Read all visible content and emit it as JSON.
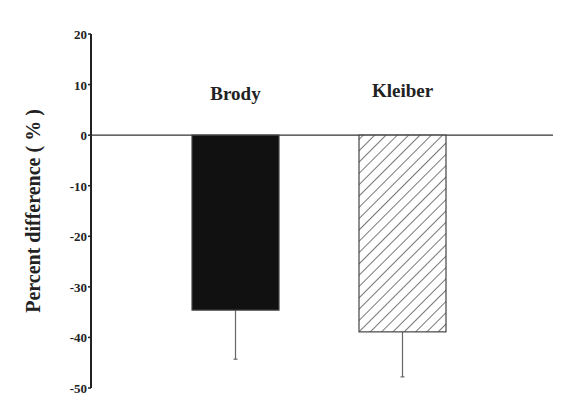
{
  "chart_data": {
    "type": "bar",
    "title": "",
    "xlabel": "",
    "ylabel": "Percent difference ( % )",
    "ylim": [
      -50,
      20
    ],
    "yticks": [
      20,
      10,
      0,
      -10,
      -20,
      -30,
      -40,
      -50
    ],
    "ytick_labels": [
      "20",
      "10",
      "0",
      "-10",
      "-20",
      "-30",
      "-40",
      "-50"
    ],
    "categories": [
      "Brody",
      "Kleiber"
    ],
    "values": [
      -34.6,
      -38.9
    ],
    "error_lower": [
      -44.3,
      -47.8
    ],
    "bar_styles": [
      "solid-black",
      "diagonal-hatch"
    ],
    "grid": false,
    "legend": "none (category labels placed above bars)"
  },
  "colors": {
    "axis": "#222222",
    "bar_solid": "#111111",
    "hatch": "#555555",
    "background": "#ffffff"
  }
}
